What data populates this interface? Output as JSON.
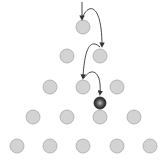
{
  "diagram": {
    "type": "galton-board",
    "peg_color": "#d3d3d3",
    "peg_stroke": "#a8a8a8",
    "ball_color": "#333333",
    "arrow_color": "#333333",
    "peg_radius": 7,
    "rows": [
      [
        [
          83,
          27
        ]
      ],
      [
        [
          67,
          56
        ],
        [
          100,
          56
        ]
      ],
      [
        [
          50,
          87
        ],
        [
          83,
          87
        ],
        [
          117,
          87
        ]
      ],
      [
        [
          33,
          117
        ],
        [
          67,
          117
        ],
        [
          100,
          117
        ],
        [
          134,
          117
        ]
      ],
      [
        [
          17,
          146
        ],
        [
          50,
          146
        ],
        [
          83,
          146
        ],
        [
          117,
          146
        ],
        [
          150,
          146
        ]
      ]
    ],
    "ball": {
      "x": 100,
      "y": 103,
      "r": 6
    },
    "path": [
      "M 82 2 L 82 19",
      "M 83 16 C 90 2, 102 6, 102 46",
      "M 100 47 C 88 36, 84 56, 83 78",
      "M 84 78 C 92 66, 102 72, 100 94"
    ]
  }
}
